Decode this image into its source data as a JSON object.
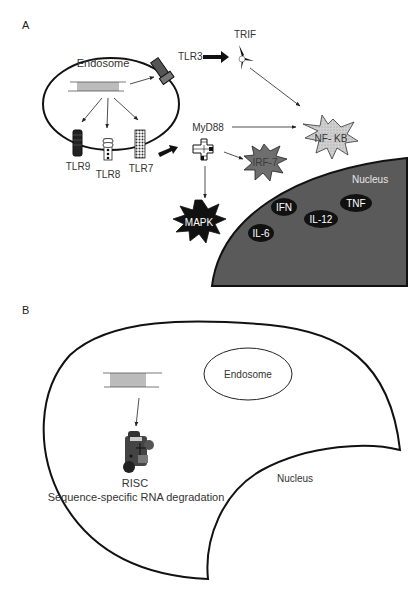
{
  "panel_a": {
    "label": "A",
    "endosome_label": "Endosome",
    "receptors": {
      "tlr3": "TLR3",
      "tlr9": "TLR9",
      "tlr8": "TLR8",
      "tlr7": "TLR7"
    },
    "adaptors": {
      "trif": "TRIF",
      "myd88": "MyD88"
    },
    "effectors": {
      "nfkb": "NF- KB",
      "irf7": "IRF-7",
      "mapk": "MAPK"
    },
    "nucleus": {
      "label": "Nucleus",
      "cytokines": [
        "IFN",
        "TNF",
        "IL-12",
        "IL-6"
      ]
    },
    "colors": {
      "nucleus_fill": "#5a5a5a",
      "irf7_fill": "#6e6e6e",
      "nfkb_fill": "#c8c8c8",
      "mapk_fill": "#111111",
      "cytokine_fill": "#111111"
    }
  },
  "panel_b": {
    "label": "B",
    "endosome_label": "Endosome",
    "nucleus_label": "Nucleus",
    "risc_label": "RISC",
    "risc_caption": "Sequence-specific RNA degradation"
  }
}
